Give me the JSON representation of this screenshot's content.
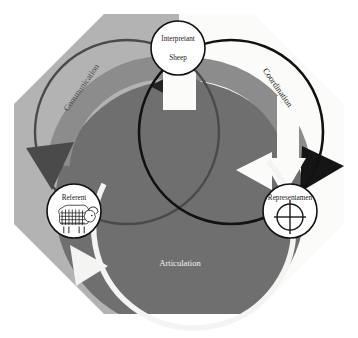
{
  "diagram": {
    "background_color": "#ffffff",
    "octagon": {
      "left_fill": "#b3b3b3",
      "right_fill": "#fbfbf9",
      "bottom_fill": "#6f6f6f"
    },
    "nodes": [
      {
        "id": "interpretant",
        "label": "Interpretant",
        "sublabel": "Sheep",
        "icon": "text-only",
        "cx": 178,
        "cy": 48,
        "r": 27,
        "fill": "#ffffff",
        "stroke": "#111111"
      },
      {
        "id": "referent",
        "label": "Referent",
        "sublabel": "",
        "icon": "sheep-icon",
        "cx": 74,
        "cy": 211,
        "r": 27,
        "fill": "#ffffff",
        "stroke": "#111111"
      },
      {
        "id": "representamen",
        "label": "Representamen",
        "sublabel": "",
        "icon": "circle-cross-icon",
        "cx": 290,
        "cy": 211,
        "r": 27,
        "fill": "#ffffff",
        "stroke": "#111111"
      }
    ],
    "relations": [
      {
        "id": "communication",
        "label": "Communication",
        "color": "#4a4a4a",
        "rotation": -55,
        "x": 82,
        "y": 88
      },
      {
        "id": "coordination",
        "label": "Coordination",
        "color": "#151515",
        "rotation": 55,
        "x": 277,
        "y": 88
      },
      {
        "id": "articulation",
        "label": "Articulation",
        "color": "#f4f4f2",
        "rotation": 0,
        "x": 180,
        "y": 264
      }
    ],
    "rings": [
      {
        "id": "communication-ring",
        "stroke": "#4a4a4a",
        "cx": 127,
        "cy": 132,
        "r": 92
      },
      {
        "id": "coordination-ring",
        "stroke": "#111111",
        "cx": 231,
        "cy": 132,
        "r": 92
      },
      {
        "id": "articulation-ring",
        "stroke": "#f4f4f2",
        "cx": 180,
        "cy": 205,
        "r": 92
      }
    ],
    "arrows": [
      {
        "id": "arrow-communication-head-top",
        "color": "#2a2a2a"
      },
      {
        "id": "arrow-communication-head-left",
        "color": "#4a4a4a"
      },
      {
        "id": "arrow-coordination-head-top",
        "color": "#6f6f6f"
      },
      {
        "id": "arrow-coordination-head-right",
        "color": "#151515"
      },
      {
        "id": "arrow-articulation-head-right",
        "color": "#f4f4f2"
      },
      {
        "id": "arrow-articulation-head-left",
        "color": "#f4f4f2"
      }
    ]
  }
}
